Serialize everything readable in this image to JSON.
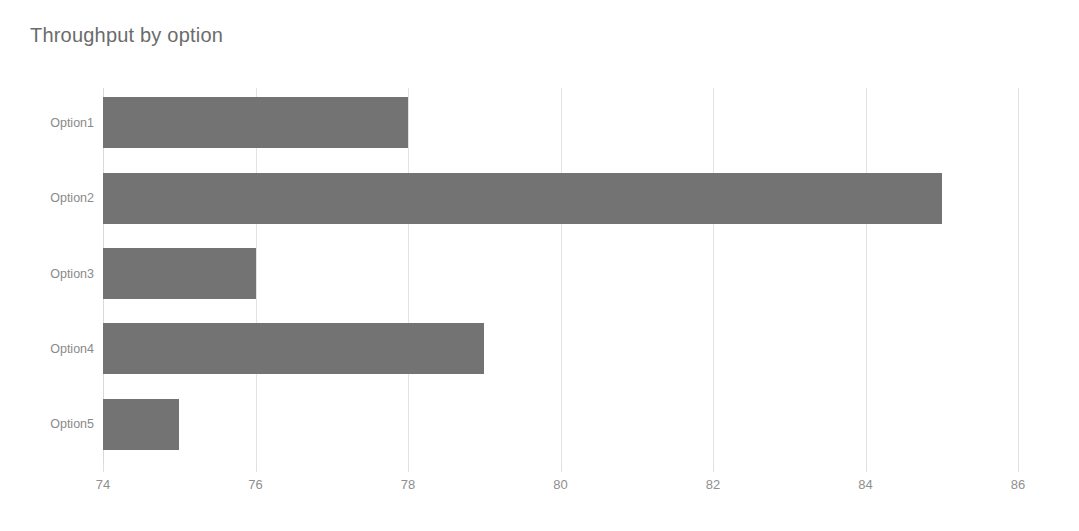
{
  "chart_data": {
    "type": "bar",
    "orientation": "horizontal",
    "title": "Throughput by option",
    "xlabel": "",
    "ylabel": "",
    "categories": [
      "Option1",
      "Option2",
      "Option3",
      "Option4",
      "Option5"
    ],
    "values": [
      78,
      85,
      76,
      79,
      75
    ],
    "xlim": [
      74,
      86
    ],
    "xticks": [
      74,
      76,
      78,
      80,
      82,
      84,
      86
    ],
    "xtick_labels": [
      "74",
      "76",
      "78",
      "80",
      "82",
      "84",
      "86"
    ],
    "grid": true,
    "grid_axis": "x",
    "legend": false,
    "bar_color": "#737373",
    "grid_color": "#e3e3e3",
    "title_color": "#6b6b6b",
    "tick_label_color": "#8f8f8f",
    "background": "#ffffff"
  }
}
